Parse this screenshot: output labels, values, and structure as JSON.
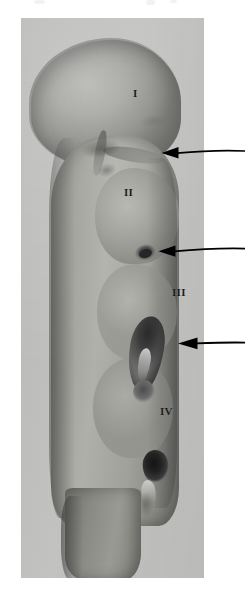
{
  "figure": {
    "background_color": "#ffffff",
    "plate_color": "#c3c3c2",
    "specimen_color": "#9a9a97",
    "annotation_color": "#000000"
  },
  "plate": {
    "name": "photo-plate",
    "left": 21,
    "top": 18,
    "width": 183,
    "height": 560
  },
  "labels": [
    {
      "id": "I",
      "text": "I",
      "region": "segment-one",
      "x": 133,
      "y": 88
    },
    {
      "id": "II",
      "text": "II",
      "region": "segment-two",
      "x": 124,
      "y": 187
    },
    {
      "id": "III",
      "text": "III",
      "region": "segment-three",
      "x": 172,
      "y": 287
    },
    {
      "id": "IV",
      "text": "IV",
      "region": "segment-four",
      "x": 160,
      "y": 406
    }
  ],
  "arrows": [
    {
      "id": "arrow-1",
      "direction": "left",
      "tip_x": 152,
      "tail_x": 245,
      "y": 152,
      "points_to": "neck-cleft-between-I-and-II"
    },
    {
      "id": "arrow-2",
      "direction": "left",
      "tip_x": 146,
      "tail_x": 245,
      "y": 250,
      "points_to": "notch-below-II"
    },
    {
      "id": "arrow-3",
      "direction": "left",
      "tip_x": 172,
      "tail_x": 245,
      "y": 343,
      "points_to": "dark-elongated-structure-at-III"
    }
  ],
  "features": [
    {
      "id": "seg-one",
      "name": "rounded-head-lobe"
    },
    {
      "id": "trunk",
      "name": "elongated-trunk"
    },
    {
      "id": "cleft-main",
      "name": "neck-cleft"
    },
    {
      "id": "notch-two",
      "name": "dark-notch"
    },
    {
      "id": "limb-bud",
      "name": "dark-elongated-structure"
    },
    {
      "id": "spot-lower",
      "name": "dark-oval-spot"
    },
    {
      "id": "stalk",
      "name": "tapering-stalk"
    }
  ]
}
